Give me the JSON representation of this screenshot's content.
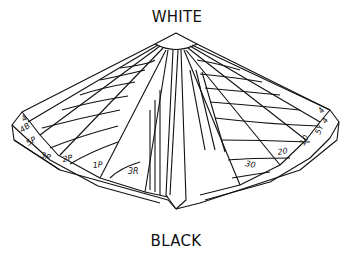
{
  "diagram": {
    "title_top": "WHITE",
    "title_bottom": "BLACK",
    "left_rim_labels": [
      "4",
      "4B",
      "5P",
      "3P",
      "2P",
      "1P",
      "3R"
    ],
    "right_rim_labels": [
      "30",
      "20",
      "10",
      "5Y",
      "4",
      "4"
    ],
    "colors": {
      "stroke": "#111111",
      "background": "#ffffff"
    }
  }
}
